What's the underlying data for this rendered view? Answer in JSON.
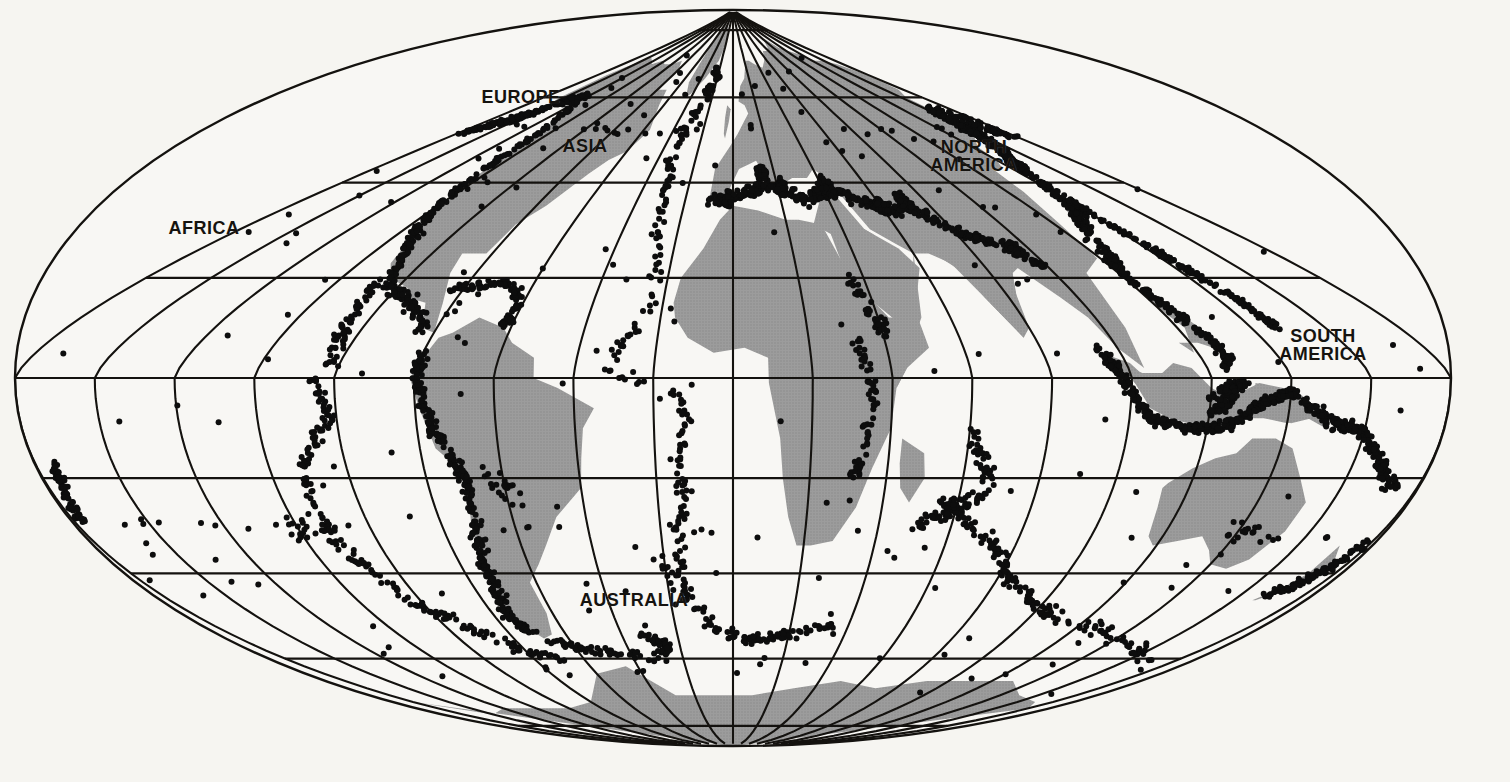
{
  "map": {
    "title": "World Distribution of Earthquake Epicenters",
    "projection": "Mollweide-style oval (equal-area) world projection",
    "background_color": "#f6f5f1",
    "land_color": "#9a9a9a",
    "ocean_color": "#f8f7f4",
    "graticule_color": "#111111",
    "epicenter_color": "#0d0d0d",
    "border_color": "#111111",
    "graticule": {
      "meridian_interval_deg": 20,
      "parallel_interval_deg": 20,
      "pole_convergence": "meridians converge at the north pole near the top centre"
    },
    "labels": [
      {
        "name": "africa",
        "text": "AFRICA",
        "x": 204,
        "y": 228,
        "size": 18
      },
      {
        "name": "europe",
        "text": "EUROPE",
        "x": 521,
        "y": 97,
        "size": 18
      },
      {
        "name": "asia",
        "text": "ASIA",
        "x": 585,
        "y": 146,
        "size": 18
      },
      {
        "name": "north-america",
        "text": "NORTH\nAMERICA",
        "x": 974,
        "y": 156,
        "size": 18
      },
      {
        "name": "south-america",
        "text": "SOUTH\nAMERICA",
        "x": 1323,
        "y": 345,
        "size": 18
      },
      {
        "name": "australia",
        "text": "AUSTRALIA",
        "x": 634,
        "y": 600,
        "size": 18
      }
    ]
  },
  "chart_data": {
    "type": "scatter",
    "xlabel": "Longitude",
    "ylabel": "Latitude",
    "xlim": [
      -180,
      180
    ],
    "ylim": [
      -90,
      90
    ],
    "grid": true,
    "legend": "none",
    "marker": {
      "shape": "circle",
      "color": "#0d0d0d",
      "diameter_px": 6
    },
    "series": [
      {
        "name": "Earthquake epicenters",
        "description": "Seismic epicenters concentrated along plate boundaries: the circum-Pacific Ring of Fire, the Alpine-Himalayan belt, and mid-ocean ridges.",
        "approx_point_count": 2100,
        "belts": [
          {
            "name": "circum-pacific-west",
            "label": "Japan-Kuril-Kamchatka-Aleutian arc",
            "density": "very-high"
          },
          {
            "name": "circum-pacific-east",
            "label": "Andes and Central America trench",
            "density": "very-high"
          },
          {
            "name": "indonesia-philippines",
            "label": "Indonesian / Philippine arcs",
            "density": "very-high"
          },
          {
            "name": "alpine-himalayan",
            "label": "Mediterranean to Himalaya belt",
            "density": "high"
          },
          {
            "name": "mid-atlantic-ridge",
            "label": "Mid-Atlantic Ridge",
            "density": "low"
          },
          {
            "name": "indian-ocean-ridge",
            "label": "Indian Ocean ridges",
            "density": "moderate"
          },
          {
            "name": "east-pacific-rise",
            "label": "East Pacific Rise",
            "density": "moderate"
          },
          {
            "name": "tonga-kermadec",
            "label": "Tonga-Kermadec-New Zealand arc",
            "density": "very-high"
          },
          {
            "name": "scotia-arc",
            "label": "Scotia Arc / South Sandwich",
            "density": "moderate"
          },
          {
            "name": "east-african-rift",
            "label": "East African Rift",
            "density": "low"
          }
        ]
      }
    ]
  }
}
